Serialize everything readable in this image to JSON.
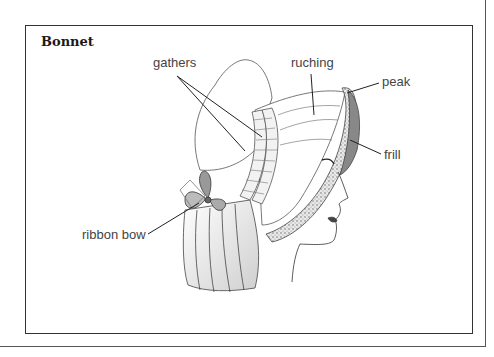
{
  "figure": {
    "title": "Bonnet",
    "labels": {
      "gathers": "gathers",
      "ruching": "ruching",
      "peak": "peak",
      "frill": "frill",
      "ribbon_bow": "ribbon bow"
    },
    "colors": {
      "line": "#222222",
      "label_text": "#444444",
      "border": "#333333"
    }
  }
}
